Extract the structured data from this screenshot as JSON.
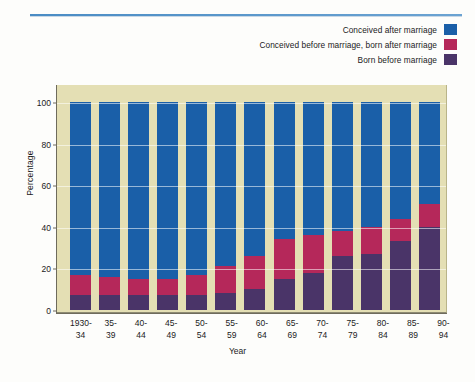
{
  "legend": {
    "position": "top-right",
    "items": [
      {
        "label": "Conceived after marriage",
        "color": "#1a5fa8",
        "key": "conceived_after_marriage"
      },
      {
        "label": "Conceived before marriage, born after marriage",
        "color": "#b5285a",
        "key": "conceived_before_born_after"
      },
      {
        "label": "Born before marriage",
        "color": "#4a3468",
        "key": "born_before_marriage"
      }
    ]
  },
  "chart_data": {
    "type": "bar",
    "subtype": "stacked-bar-100-percent",
    "title": "",
    "xlabel": "Year",
    "ylabel": "Percentage",
    "ylim": [
      0,
      100
    ],
    "yticks": [
      0,
      20,
      40,
      60,
      80,
      100
    ],
    "grid": true,
    "categories": [
      "1930-34",
      "35-39",
      "40-44",
      "45-49",
      "50-54",
      "55-59",
      "60-64",
      "65-69",
      "70-74",
      "75-79",
      "80-84",
      "85-89",
      "90-94"
    ],
    "categories_lines": [
      [
        "1930-",
        "34"
      ],
      [
        "35-",
        "39"
      ],
      [
        "40-",
        "44"
      ],
      [
        "45-",
        "49"
      ],
      [
        "50-",
        "54"
      ],
      [
        "55-",
        "59"
      ],
      [
        "60-",
        "64"
      ],
      [
        "65-",
        "69"
      ],
      [
        "70-",
        "74"
      ],
      [
        "75-",
        "79"
      ],
      [
        "80-",
        "84"
      ],
      [
        "85-",
        "89"
      ],
      [
        "90-",
        "94"
      ]
    ],
    "series": [
      {
        "name": "Born before marriage",
        "color": "#4a3468",
        "values": [
          7,
          7,
          7,
          7,
          7,
          8,
          10,
          15,
          18,
          26,
          27,
          33,
          40
        ]
      },
      {
        "name": "Conceived before marriage, born after marriage",
        "color": "#b5285a",
        "values": [
          10,
          9,
          8,
          8,
          10,
          13,
          16,
          19,
          18,
          12,
          13,
          11,
          11
        ]
      },
      {
        "name": "Conceived after marriage",
        "color": "#1a5fa8",
        "values": [
          83,
          84,
          85,
          85,
          83,
          79,
          74,
          66,
          64,
          62,
          60,
          56,
          49
        ]
      }
    ],
    "stack_order_bottom_to_top": [
      "Born before marriage",
      "Conceived before marriage, born after marriage",
      "Conceived after marriage"
    ],
    "colors": {
      "blue": "#1a5fa8",
      "crimson": "#b5285a",
      "purple": "#4a3468",
      "panel_background": "#e4dfb4",
      "gridline": "#ffffff"
    }
  }
}
